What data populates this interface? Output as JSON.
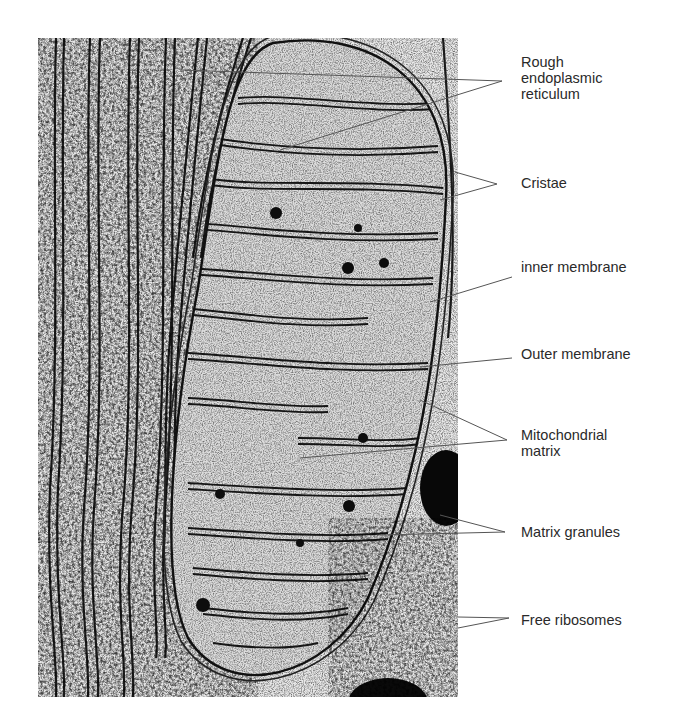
{
  "figure": {
    "labels": [
      {
        "id": "rough-er",
        "text": "Rough\nendoplasmic\nreticulum",
        "y": 54,
        "tip": [
          502,
          81
        ],
        "targets": [
          [
            180,
            70
          ],
          [
            280,
            150
          ]
        ]
      },
      {
        "id": "cristae",
        "text": "Cristae",
        "y": 175,
        "tip": [
          497,
          184
        ],
        "targets": [
          [
            455,
            172
          ],
          [
            440,
            200
          ]
        ]
      },
      {
        "id": "inner-membrane",
        "text": "inner membrane",
        "y": 259,
        "tip": [
          512,
          277
        ],
        "targets": [
          [
            430,
            302
          ]
        ]
      },
      {
        "id": "outer-membrane",
        "text": "Outer membrane",
        "y": 346,
        "tip": [
          512,
          358
        ],
        "targets": [
          [
            420,
            367
          ]
        ]
      },
      {
        "id": "mitochondrial-matrix",
        "text": "Mitochondrial\nmatrix",
        "y": 427,
        "tip": [
          507,
          440
        ],
        "targets": [
          [
            420,
            400
          ],
          [
            300,
            458
          ]
        ]
      },
      {
        "id": "matrix-granules",
        "text": "Matrix granules",
        "y": 524,
        "tip": [
          505,
          532
        ],
        "targets": [
          [
            440,
            515
          ],
          [
            380,
            535
          ]
        ]
      },
      {
        "id": "free-ribosomes",
        "text": "Free ribosomes",
        "y": 612,
        "tip": [
          509,
          618
        ],
        "targets": [
          [
            458,
            617
          ],
          [
            458,
            628
          ]
        ]
      }
    ]
  },
  "colors": {
    "label_text": "#2a2a2a",
    "leader_line": "#555555",
    "background": "#ffffff",
    "micrograph_light": "#e6e6e6",
    "micrograph_dark": "#111111"
  }
}
